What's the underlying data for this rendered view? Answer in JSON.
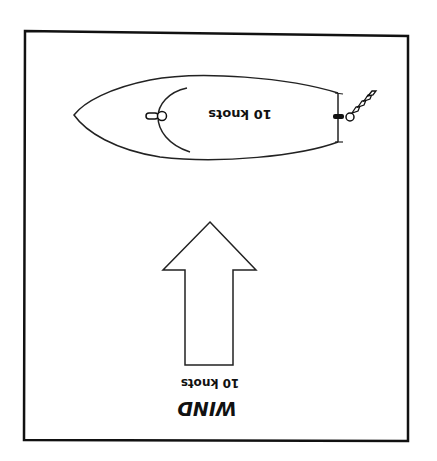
{
  "diagram": {
    "boat": {
      "speed_label": "10 knots"
    },
    "wind": {
      "speed_label": "10 knots",
      "title": "WIND"
    },
    "colors": {
      "ink": "#111111",
      "background": "#ffffff"
    }
  }
}
